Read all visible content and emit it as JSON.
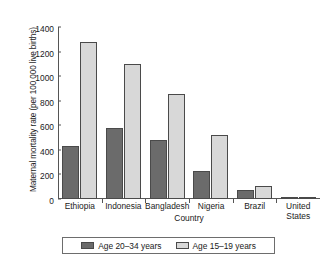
{
  "chart_data": {
    "type": "bar",
    "title": "",
    "xlabel": "Country",
    "ylabel": "Maternal mortality rate (per 100 000 live births)",
    "categories": [
      "Ethiopia",
      "Indonesia",
      "Bangladesh",
      "Nigeria",
      "Brazil",
      "United States"
    ],
    "category_lines": [
      [
        "Ethiopia"
      ],
      [
        "Indonesia"
      ],
      [
        "Bangladesh"
      ],
      [
        "Nigeria"
      ],
      [
        "Brazil"
      ],
      [
        "United",
        "States"
      ]
    ],
    "series": [
      {
        "name": "Age 20–34 years",
        "color": "#6b6b6b",
        "values": [
          435,
          575,
          480,
          230,
          75,
          10
        ]
      },
      {
        "name": "Age 15–19 years",
        "color": "#d8d8d8",
        "values": [
          1275,
          1100,
          855,
          525,
          105,
          13
        ]
      }
    ],
    "ylim": [
      0,
      1400
    ],
    "yticks": [
      0,
      200,
      400,
      600,
      800,
      1000,
      1200,
      1400
    ],
    "ytick_labels": [
      "0",
      "200",
      "400",
      "600",
      "800",
      "1000",
      "1200",
      "1400"
    ],
    "grid": false,
    "legend_position": "bottom-center",
    "axis_color": "#555555",
    "bar_border_color": "#4a4a4a"
  }
}
